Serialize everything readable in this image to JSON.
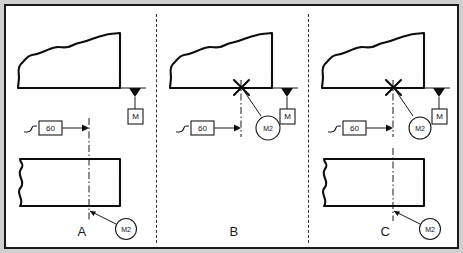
{
  "diagram": {
    "background_color": "#d0d0d0",
    "frame_color": "#1a1a1a",
    "line_color": "#0d0d0d"
  },
  "panels": [
    {
      "id": "A",
      "label": "A",
      "dimension_value": "60",
      "surface_symbol_label": "M",
      "callout_label": "M2",
      "has_top_profile": true,
      "has_bottom_view": true,
      "has_x_mark": false,
      "top_callout": null
    },
    {
      "id": "B",
      "label": "B",
      "dimension_value": "60",
      "surface_symbol_label": "M",
      "callout_label": "M2",
      "has_top_profile": true,
      "has_bottom_view": false,
      "has_x_mark": true,
      "top_callout": "M2"
    },
    {
      "id": "C",
      "label": "C",
      "dimension_value": "60",
      "surface_symbol_label": "M",
      "callout_label": "M2",
      "has_top_profile": true,
      "has_bottom_view": true,
      "has_x_mark": true,
      "top_callout": "M2"
    }
  ],
  "symbols": {
    "datum_triangle": "filled-triangle",
    "dimension_arrow": "arrow-right",
    "ramp_glyph": "ramp-curve",
    "break_line": "wavy-break",
    "center_line": "dash-dot"
  }
}
